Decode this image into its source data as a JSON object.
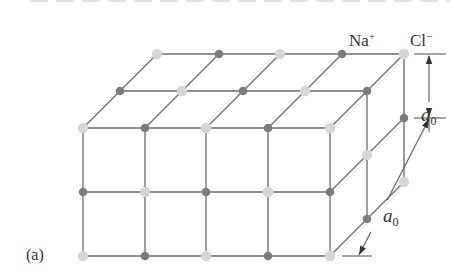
{
  "figure": {
    "panel_label": "(a)",
    "ion_labels": {
      "sodium": {
        "base": "Na",
        "charge": "+"
      },
      "chloride": {
        "base": "Cl",
        "charge": "−"
      }
    },
    "dimension_label": {
      "base": "a",
      "subscript": "0"
    },
    "colors": {
      "background": "#ffffff",
      "line": "#6b6b6b",
      "na_atom": "#7c7c7c",
      "cl_atom": "#d6d6d6",
      "text": "#333333"
    },
    "lattice": {
      "front_face_cols_x": [
        83,
        145,
        206,
        268,
        330
      ],
      "front_face_rows_y": [
        128,
        192,
        256
      ],
      "depth_step": [
        37,
        -37
      ],
      "depth_layers": 3
    }
  }
}
